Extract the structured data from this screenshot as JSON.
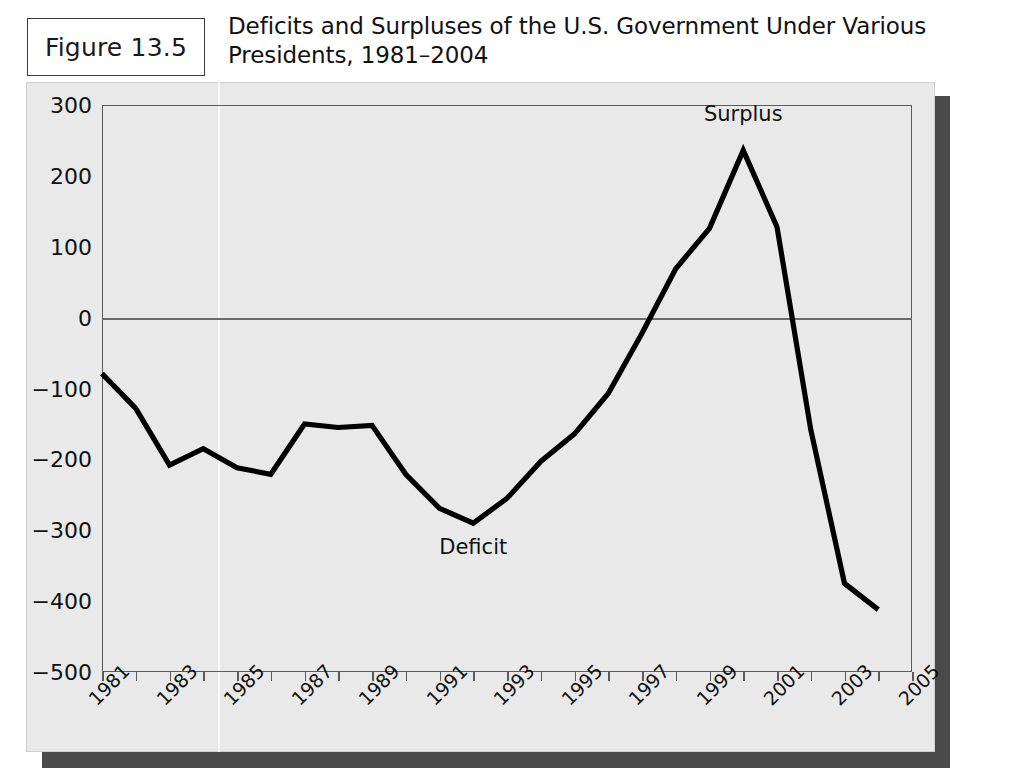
{
  "figure": {
    "badge_label": "Figure 13.5",
    "title": "Deficits and Surpluses of the U.S. Government Under Various Presidents, 1981–2004"
  },
  "colors": {
    "panel_bg": "#e9e9e9",
    "series_line": "#000000",
    "frame": "#5b5b5b",
    "shadow": "#4a4a4a",
    "text": "#111111"
  },
  "chart_data": {
    "type": "line",
    "title": "Deficits and Surpluses of the U.S. Government Under Various Presidents, 1981–2004",
    "xlabel": "",
    "ylabel": "",
    "xlim": [
      1981,
      2005
    ],
    "ylim": [
      -500,
      300
    ],
    "grid": false,
    "legend": "none",
    "y_ticks": [
      300,
      200,
      100,
      0,
      -100,
      -200,
      -300,
      -400,
      -500
    ],
    "y_tick_labels": [
      "300",
      "200",
      "100",
      "0",
      "−100",
      "−200",
      "−300",
      "−400",
      "−500"
    ],
    "x_ticks": [
      1981,
      1982,
      1983,
      1984,
      1985,
      1986,
      1987,
      1988,
      1989,
      1990,
      1991,
      1992,
      1993,
      1994,
      1995,
      1996,
      1997,
      1998,
      1999,
      2000,
      2001,
      2002,
      2003,
      2004,
      2005
    ],
    "x_tick_labels": [
      "1981",
      "1983",
      "1985",
      "1987",
      "1989",
      "1991",
      "1993",
      "1995",
      "1997",
      "1999",
      "2001",
      "2003",
      "2005"
    ],
    "x_labeled_ticks": [
      1981,
      1983,
      1985,
      1987,
      1989,
      1991,
      1993,
      1995,
      1997,
      1999,
      2001,
      2003,
      2005
    ],
    "series": [
      {
        "name": "Federal budget balance",
        "x": [
          1981,
          1982,
          1983,
          1984,
          1985,
          1986,
          1987,
          1988,
          1989,
          1990,
          1991,
          1992,
          1993,
          1994,
          1995,
          1996,
          1997,
          1998,
          1999,
          2000,
          2001,
          2002,
          2003,
          2004
        ],
        "values": [
          -79,
          -128,
          -208,
          -185,
          -212,
          -221,
          -150,
          -155,
          -152,
          -221,
          -269,
          -290,
          -255,
          -203,
          -164,
          -107,
          -22,
          69,
          126,
          236,
          128,
          -158,
          -375,
          -412
        ]
      }
    ],
    "annotations": [
      {
        "text": "Surplus",
        "x": 2000,
        "y": 285
      },
      {
        "text": "Deficit",
        "x": 1992,
        "y": -327
      }
    ],
    "zero_reference_line": 0
  }
}
